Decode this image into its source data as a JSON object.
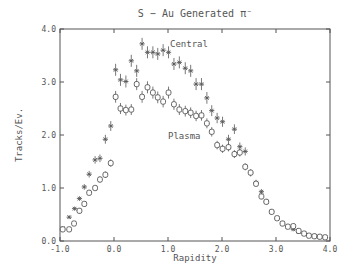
{
  "chart_data": {
    "type": "scatter",
    "title": "S − Au Generated π⁻",
    "xlabel": "Rapidity",
    "ylabel": "Tracks/Ev.",
    "xlim": [
      -1.0,
      4.0
    ],
    "ylim": [
      0.0,
      4.0
    ],
    "xticks": [
      "-1.0",
      "0.0",
      "1.0",
      "2.0",
      "3.0",
      "4.0"
    ],
    "yticks": [
      "0.0",
      "1.0",
      "2.0",
      "3.0",
      "4.0"
    ],
    "grid": false,
    "annotations": [
      {
        "text": "Central",
        "x": 1.05,
        "y": 3.65
      },
      {
        "text": "Plasma",
        "x": 1.0,
        "y": 1.95
      }
    ],
    "series": [
      {
        "name": "Central",
        "marker": "star",
        "x": [
          -0.95,
          -0.83,
          -0.73,
          -0.64,
          -0.55,
          -0.46,
          -0.35,
          -0.26,
          -0.16,
          -0.06,
          0.03,
          0.12,
          0.22,
          0.32,
          0.42,
          0.52,
          0.62,
          0.72,
          0.81,
          0.91,
          1.01,
          1.11,
          1.21,
          1.32,
          1.42,
          1.52,
          1.62,
          1.72,
          1.81,
          1.91,
          2.01,
          2.12,
          2.23,
          2.33,
          2.43,
          2.53,
          2.63,
          2.73,
          2.82,
          2.92,
          3.02,
          3.12,
          3.22,
          3.32,
          3.42,
          3.52,
          3.61,
          3.71,
          3.81,
          3.91
        ],
        "y": [
          0.24,
          0.45,
          0.61,
          0.8,
          1.02,
          1.26,
          1.53,
          1.56,
          1.92,
          2.17,
          3.23,
          3.04,
          3.01,
          3.4,
          3.21,
          3.72,
          3.56,
          3.56,
          3.53,
          3.6,
          3.56,
          3.34,
          3.37,
          3.26,
          3.21,
          2.96,
          2.96,
          2.7,
          2.46,
          2.32,
          2.25,
          1.92,
          2.11,
          1.78,
          1.69,
          1.28,
          1.1,
          0.93,
          0.74,
          0.55,
          0.43,
          0.34,
          0.27,
          0.22,
          0.17,
          0.14,
          0.11,
          0.09,
          0.08,
          0.07
        ]
      },
      {
        "name": "Plasma",
        "marker": "open-circle",
        "x": [
          -0.95,
          -0.83,
          -0.74,
          -0.64,
          -0.55,
          -0.46,
          -0.35,
          -0.26,
          -0.16,
          -0.06,
          0.03,
          0.12,
          0.22,
          0.32,
          0.42,
          0.52,
          0.62,
          0.72,
          0.81,
          0.91,
          1.01,
          1.11,
          1.21,
          1.32,
          1.42,
          1.52,
          1.62,
          1.72,
          1.81,
          1.91,
          2.01,
          2.12,
          2.23,
          2.33,
          2.43,
          2.53,
          2.63,
          2.73,
          2.82,
          2.92,
          3.02,
          3.12,
          3.22,
          3.32,
          3.42,
          3.52,
          3.61,
          3.71,
          3.81,
          3.91
        ],
        "y": [
          0.22,
          0.22,
          0.33,
          0.57,
          0.7,
          0.91,
          1.0,
          1.16,
          1.25,
          1.47,
          2.72,
          2.5,
          2.47,
          2.48,
          2.96,
          2.72,
          2.9,
          2.8,
          2.71,
          2.63,
          2.8,
          2.58,
          2.48,
          2.45,
          2.42,
          2.36,
          2.37,
          2.22,
          2.06,
          1.81,
          1.74,
          1.77,
          1.64,
          1.67,
          1.4,
          1.29,
          1.08,
          0.84,
          0.74,
          0.55,
          0.43,
          0.33,
          0.27,
          0.28,
          0.19,
          0.14,
          0.1,
          0.09,
          0.08,
          0.07
        ]
      }
    ]
  },
  "colors": {
    "ink": "#555555",
    "background": "#ffffff"
  }
}
